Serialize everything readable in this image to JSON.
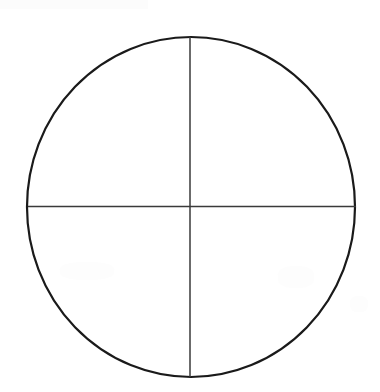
{
  "canvas": {
    "width": 380,
    "height": 392,
    "background_color": "#ffffff"
  },
  "figure": {
    "title": "Circle divided into four quadrants",
    "type": "geometric-line-drawing",
    "style": "hand-drawn black ink on white paper"
  },
  "circle": {
    "name": "circle-outline",
    "center_x": 191,
    "center_y": 207,
    "radius_x": 164,
    "radius_y": 170,
    "stroke_color": "#1a1a1a",
    "stroke_width": 2.2,
    "fill": "none",
    "top_y": 37,
    "bottom_y": 377,
    "left_x": 27,
    "right_x": 355
  },
  "vertical_diameter": {
    "name": "vertical-diameter-line",
    "x": 190,
    "y_start": 37,
    "y_end": 377,
    "stroke_color": "#3a3a3a",
    "stroke_width": 1.5
  },
  "horizontal_diameter": {
    "name": "horizontal-diameter-line",
    "y": 206.5,
    "x_start": 28,
    "x_end": 356,
    "stroke_color": "#3a3a3a",
    "stroke_width": 1.5
  },
  "quadrants": [
    {
      "name": "upper-left-quadrant",
      "label": ""
    },
    {
      "name": "upper-right-quadrant",
      "label": ""
    },
    {
      "name": "lower-left-quadrant",
      "label": ""
    },
    {
      "name": "lower-right-quadrant",
      "label": ""
    }
  ],
  "labels": [],
  "annotations": []
}
